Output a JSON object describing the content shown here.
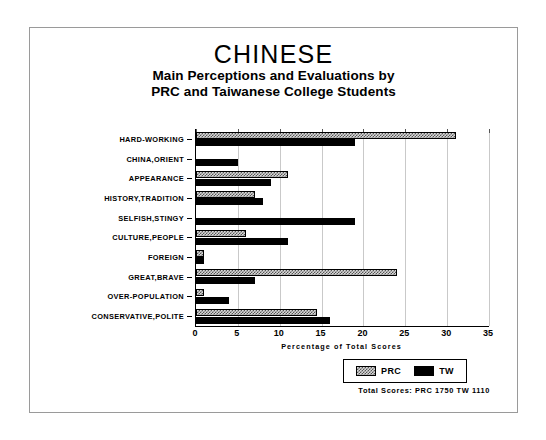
{
  "chart_data": {
    "type": "bar",
    "orientation": "horizontal",
    "title": "CHINESE",
    "subtitle_line1": "Main Perceptions and Evaluations by",
    "subtitle_line2": "PRC and Taiwanese College Students",
    "xlabel": "Percentage of Total Scores",
    "ylabel": "",
    "xlim": [
      0,
      35
    ],
    "xticks": [
      0,
      5,
      10,
      15,
      20,
      25,
      30,
      35
    ],
    "grid": true,
    "legend_position": "bottom-right",
    "categories": [
      "HARD-WORKING",
      "CHINA,ORIENT",
      "APPEARANCE",
      "HISTORY,TRADITION",
      "SELFISH,STINGY",
      "CULTURE,PEOPLE",
      "FOREIGN",
      "GREAT,BRAVE",
      "OVER-POPULATION",
      "CONSERVATIVE,POLITE"
    ],
    "series": [
      {
        "name": "PRC",
        "pattern": "hatched",
        "values": [
          31,
          0,
          11,
          7,
          0,
          6,
          1,
          24,
          1,
          14.5
        ]
      },
      {
        "name": "TW",
        "pattern": "solid",
        "values": [
          19,
          5,
          9,
          8,
          19,
          11,
          1,
          7,
          4,
          16
        ]
      }
    ]
  },
  "legend": {
    "items": [
      {
        "label": "PRC",
        "swatch": "hatched-swatch-icon"
      },
      {
        "label": "TW",
        "swatch": "solid-black-swatch-icon"
      }
    ]
  },
  "footer": {
    "text": "Total Scores:  PRC 1750   TW 1110"
  }
}
